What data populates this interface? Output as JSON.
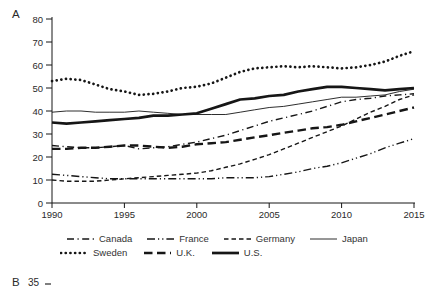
{
  "panel_a_label": "A",
  "panel_b": {
    "label": "B",
    "tick_label": "35"
  },
  "chart_data": {
    "type": "line",
    "title": "",
    "xlabel": "",
    "ylabel": "",
    "xlim": [
      1990,
      2015
    ],
    "ylim": [
      0,
      80
    ],
    "grid": false,
    "x_ticks": [
      1990,
      1995,
      2000,
      2005,
      2010,
      2015
    ],
    "y_ticks": [
      0,
      10,
      20,
      30,
      40,
      50,
      60,
      70,
      80
    ],
    "x": [
      1990,
      1991,
      1992,
      1993,
      1994,
      1995,
      1996,
      1997,
      1998,
      1999,
      2000,
      2001,
      2002,
      2003,
      2004,
      2005,
      2006,
      2007,
      2008,
      2009,
      2010,
      2011,
      2012,
      2013,
      2014,
      2015
    ],
    "color": "#161616",
    "legend_position": "below",
    "legend_rows": [
      [
        "Canada",
        "France",
        "Germany",
        "Japan"
      ],
      [
        "Sweden",
        "U.K.",
        "U.S."
      ]
    ],
    "series": [
      {
        "name": "Canada",
        "dash": "7 3.5 1.2 3.5",
        "width": 1.4,
        "cap": "butt",
        "values": [
          25,
          24.5,
          24,
          24,
          24.5,
          25,
          23.5,
          24,
          24.5,
          25.5,
          26.5,
          28,
          29.5,
          31.5,
          33.5,
          35.5,
          37,
          38.5,
          40,
          42,
          44,
          45,
          45.5,
          46.5,
          47,
          47.5
        ]
      },
      {
        "name": "France",
        "dash": "8 3 1.2 3 1.2 3",
        "width": 1.4,
        "cap": "butt",
        "values": [
          12.5,
          12,
          11.5,
          11,
          10.5,
          10.5,
          10.5,
          10.5,
          10.5,
          10.5,
          10.5,
          10.5,
          11,
          11,
          11,
          11.5,
          12.5,
          13.5,
          15,
          16,
          17.5,
          19.5,
          21.5,
          24,
          26,
          28
        ]
      },
      {
        "name": "Germany",
        "dash": "4.5 3",
        "width": 1.4,
        "cap": "butt",
        "values": [
          10,
          9.5,
          9.5,
          9.5,
          10,
          10.5,
          11,
          11.5,
          12,
          12.5,
          13,
          14,
          15.5,
          17,
          19,
          21,
          23.5,
          26,
          28.5,
          31,
          33.5,
          36.5,
          39.5,
          42,
          45,
          47
        ]
      },
      {
        "name": "Japan",
        "dash": "",
        "width": 0.9,
        "cap": "butt",
        "values": [
          39.5,
          40,
          40,
          39.5,
          39.5,
          39.5,
          40,
          39.5,
          39,
          38.5,
          38.5,
          38.5,
          38.5,
          39.5,
          40.5,
          41.5,
          42,
          43,
          44,
          45,
          46,
          46,
          46.5,
          47,
          48.5,
          49.5
        ]
      },
      {
        "name": "Sweden",
        "dash": "0.1 4.6",
        "width": 2.7,
        "cap": "round",
        "values": [
          53,
          54,
          53.5,
          51.5,
          49.5,
          48.5,
          47,
          47.5,
          48.5,
          50,
          50.5,
          52,
          54.5,
          57,
          58.5,
          59,
          59.5,
          59,
          59.5,
          59,
          58.5,
          59,
          60,
          61.5,
          64,
          66
        ]
      },
      {
        "name": "U.K.",
        "dash": "8.5 4.5",
        "width": 2.4,
        "cap": "butt",
        "values": [
          23.5,
          23.5,
          24,
          24,
          24.5,
          25,
          25,
          24.5,
          24,
          24.5,
          25.5,
          26,
          26.5,
          27.5,
          28.5,
          29.5,
          30.5,
          31.5,
          32.5,
          33,
          34,
          35.5,
          37,
          38.5,
          40,
          41.5
        ]
      },
      {
        "name": "U.S.",
        "dash": "",
        "width": 2.7,
        "cap": "butt",
        "values": [
          35,
          34.5,
          35,
          35.5,
          36,
          36.5,
          37,
          38,
          38,
          38.5,
          39,
          41,
          43,
          45,
          45.5,
          46.5,
          47,
          48.5,
          49.5,
          50.5,
          50.5,
          50,
          49.5,
          49,
          49.5,
          50
        ]
      }
    ]
  }
}
